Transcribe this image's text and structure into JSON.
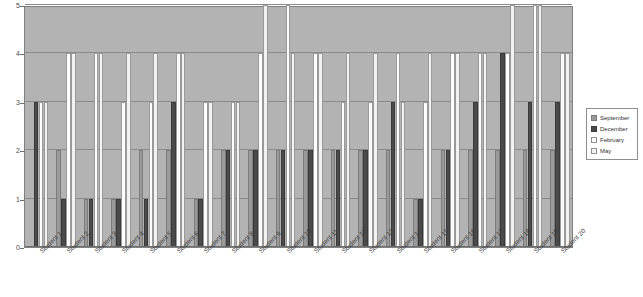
{
  "chart_data": {
    "type": "bar",
    "title": "",
    "xlabel": "",
    "ylabel": "",
    "ylim": [
      0,
      5
    ],
    "yticks": [
      0,
      1,
      2,
      3,
      4,
      5
    ],
    "grid": true,
    "legend_position": "right",
    "categories": [
      "Student 1",
      "Student 2",
      "Student 3",
      "Student 4",
      "Student 5",
      "Student 6",
      "Student 7",
      "Student 8",
      "Student 9",
      "Student 10",
      "Student 11",
      "Student 12",
      "Student 13",
      "Student 14",
      "Student 15",
      "Student 16",
      "Student 17",
      "Student 18",
      "Student 19",
      "Student 20"
    ],
    "series": [
      {
        "name": "September",
        "color": "#9a9a9a",
        "values": [
          0,
          2,
          1,
          1,
          2,
          2,
          1,
          2,
          2,
          2,
          2,
          2,
          2,
          2,
          1,
          2,
          2,
          2,
          2,
          2
        ]
      },
      {
        "name": "December",
        "color": "#4a4a4a",
        "values": [
          3,
          1,
          1,
          1,
          1,
          3,
          1,
          2,
          2,
          2,
          2,
          2,
          2,
          3,
          1,
          2,
          3,
          4,
          3,
          3
        ]
      },
      {
        "name": "February",
        "color": "#fdfdfd",
        "values": [
          3,
          4,
          4,
          3,
          3,
          4,
          3,
          3,
          4,
          5,
          4,
          3,
          3,
          4,
          3,
          4,
          4,
          4,
          5,
          4
        ]
      },
      {
        "name": "May",
        "color": "#f2f2f2",
        "values": [
          3,
          4,
          4,
          4,
          4,
          4,
          3,
          3,
          5,
          4,
          4,
          4,
          4,
          3,
          4,
          4,
          4,
          5,
          5,
          4
        ]
      }
    ]
  },
  "legend": {
    "items": [
      {
        "label": "September",
        "swatch": "#9a9a9a",
        "border": "#7c7c7c"
      },
      {
        "label": "December",
        "swatch": "#4a4a4a",
        "border": "#3a3a3a"
      },
      {
        "label": "February",
        "swatch": "#fdfdfd",
        "border": "#8f8f8f"
      },
      {
        "label": "May",
        "swatch": "#f2f2f2",
        "border": "#8f8f8f"
      }
    ]
  },
  "axis": {
    "y_tick_labels": [
      "0",
      "1",
      "2",
      "3",
      "4",
      "5"
    ]
  },
  "colors": {
    "plot_background": "#b3b3b3",
    "gridline": "#8a8a8a",
    "page_background": "#ffffff"
  }
}
